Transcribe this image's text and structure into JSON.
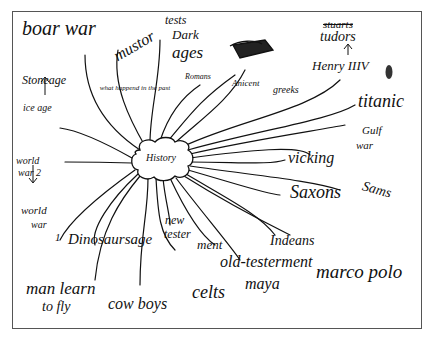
{
  "mindmap": {
    "center": "History",
    "subtitle": "what happend in the past",
    "labels": {
      "boar_war": "boar war",
      "muster_tests": "mustor",
      "tests": "tests",
      "dark_ages": "Dark",
      "ages": "ages",
      "romans": "Romans",
      "ancient_greeks_1": "Anicent",
      "ancient_greeks_2": "greeks",
      "stuarts": "stuarts",
      "tudors": "tudors",
      "henry": "Henry IIIV",
      "stone_age": "Stoneage",
      "ice_age": "ice age",
      "titanic": "titanic",
      "gulf_war_1": "Gulf",
      "gulf_war_2": "war",
      "vicking": "vicking",
      "saxons": "Saxons",
      "samsung": "Sams",
      "ww2_1": "world",
      "ww2_2": "war 2",
      "ww1_1": "world",
      "ww1_2": "war",
      "ww1_3": "1",
      "dinosaur_age": "Dinosaursage",
      "new_testament_1": "new",
      "new_testament_2": "tester",
      "new_testament_3": "ment",
      "indians": "Indeans",
      "old_testament": "old-testerment",
      "marco_polo": "marco polo",
      "celts": "celts",
      "maya": "maya",
      "man_learn_1": "man learn",
      "man_learn_2": "to fly",
      "cowboys": "cow boys"
    }
  }
}
